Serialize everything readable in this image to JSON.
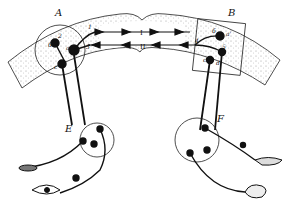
{
  "diagram": {
    "type": "neural pathway schematic",
    "regions": {
      "A": {
        "label": "A",
        "sublabels": [
          "1",
          "2",
          "3",
          "a",
          "б",
          "c"
        ]
      },
      "B": {
        "label": "B",
        "sublabels": [
          "б",
          "a'",
          "4",
          "5",
          "c'",
          "d"
        ]
      },
      "E": {
        "label": "E"
      },
      "F": {
        "label": "F"
      }
    },
    "pathways": {
      "upper": "I",
      "lower": "II"
    },
    "organs": [
      "muscle",
      "eye",
      "gland",
      "intestine"
    ],
    "colors": {
      "ink": "#111111",
      "stipple": "#9a9a9a",
      "background": "#ffffff"
    }
  }
}
